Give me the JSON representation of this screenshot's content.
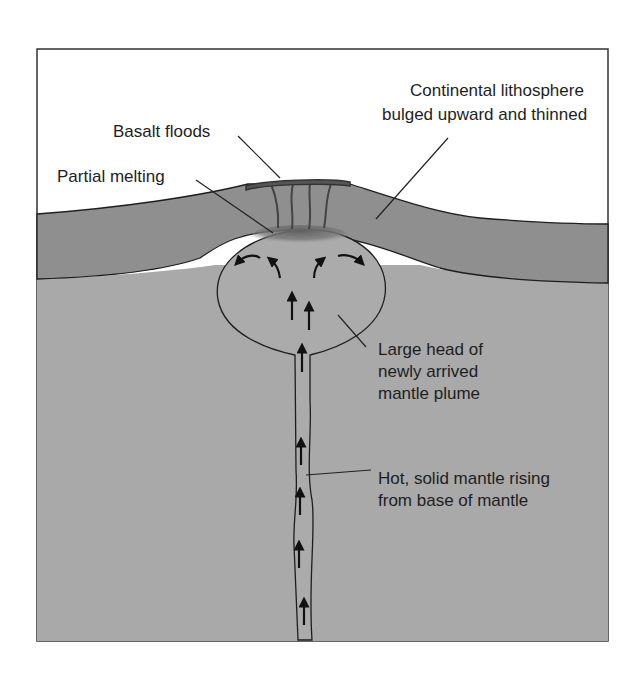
{
  "diagram": {
    "colors": {
      "sky": "#ffffff",
      "lithosphere": "#8f8f8f",
      "mantle": "#a9a9a9",
      "plume": "#ababab",
      "melt": "#6f6f6f",
      "basalt": "#555555",
      "outline": "#1e1e1e"
    },
    "labels": {
      "lithosphere": {
        "line1": "Continental lithosphere",
        "line2": "bulged upward and thinned"
      },
      "basalt": "Basalt floods",
      "melting": "Partial melting",
      "plume_head": {
        "line1": "Large head of",
        "line2": "newly arrived",
        "line3": "mantle plume"
      },
      "plume_tail": {
        "line1": "Hot, solid mantle rising",
        "line2": "from base of mantle"
      }
    },
    "layers": [
      "sky",
      "continental-lithosphere",
      "mantle",
      "plume-head",
      "plume-tail",
      "basalt-cap",
      "melt-zone"
    ],
    "arrows": {
      "head_flow": [
        "outward-left",
        "up-left",
        "up-right",
        "outward-right"
      ],
      "head_rise": 2,
      "tail_rise": 5
    }
  }
}
